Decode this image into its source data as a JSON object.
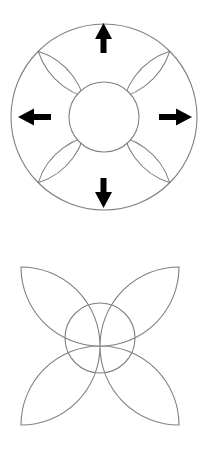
{
  "figures": [
    {
      "name": "circle-with-four-lobes-and-arrows",
      "caption": "",
      "outer_circle": {
        "cx": 104,
        "cy": 117,
        "r": 93
      },
      "inner_circle": {
        "cx": 104,
        "cy": 117,
        "r": 35
      },
      "lobes": [
        {
          "direction": "top",
          "cx": 104,
          "cy": -1,
          "r": 69
        },
        {
          "direction": "right",
          "cx": 209,
          "cy": 117,
          "r": 69
        },
        {
          "direction": "bottom",
          "cx": 104,
          "cy": 235,
          "r": 69
        },
        {
          "direction": "left",
          "cx": -1,
          "cy": 117,
          "r": 69
        }
      ],
      "arrows": [
        {
          "name": "arrow-up",
          "direction": "up",
          "x": 104,
          "y1": 52,
          "y2": 24
        },
        {
          "name": "arrow-right",
          "direction": "right",
          "y": 117,
          "x1": 160,
          "x2": 192
        },
        {
          "name": "arrow-down",
          "direction": "down",
          "x": 104,
          "y1": 178,
          "y2": 208
        },
        {
          "name": "arrow-left",
          "direction": "left",
          "y": 117,
          "x1": 50,
          "x2": 18
        }
      ]
    },
    {
      "name": "four-pointed-star-result",
      "caption": "",
      "inner_circle": {
        "cx": 100,
        "cy": 338,
        "r": 35
      },
      "cusps": [
        {
          "x": 21,
          "y": 67
        },
        {
          "x": 179,
          "y": 67
        },
        {
          "x": 179,
          "y": 168
        },
        {
          "x": 21,
          "y": 168
        }
      ]
    }
  ],
  "colors": {
    "stroke": "#808080",
    "arrow": "#000000",
    "background": "#ffffff"
  }
}
